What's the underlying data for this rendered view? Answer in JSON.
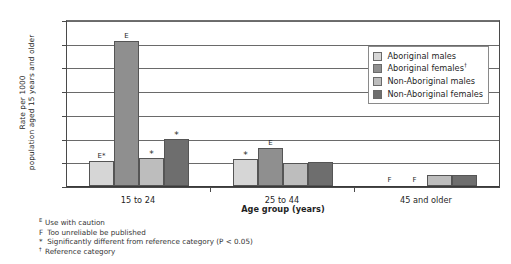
{
  "chart_data": {
    "type": "bar",
    "title": "",
    "xlabel": "Age group (years)",
    "ylabel": "Rate per 1000 population aged 15 years and older",
    "categories": [
      "15 to 24",
      "25 to 44",
      "45 and older"
    ],
    "ylim": [
      0,
      700
    ],
    "yticks": [
      0,
      100,
      200,
      300,
      400,
      500,
      600,
      700
    ],
    "grid": true,
    "legend_position": "top-right-inside",
    "series": [
      {
        "name": "Aboriginal males",
        "color": "#d6d6d6",
        "values": [
          105,
          115,
          null
        ],
        "markers": [
          "E*",
          "*",
          "F"
        ]
      },
      {
        "name": "Aboriginal females†",
        "color": "#8f8f8f",
        "values": [
          612,
          162,
          null
        ],
        "markers": [
          "E",
          "E",
          "F"
        ]
      },
      {
        "name": "Non-Aboriginal males",
        "color": "#bdbdbd",
        "values": [
          118,
          95,
          48
        ],
        "markers": [
          "*",
          "",
          ""
        ]
      },
      {
        "name": "Non-Aboriginal females",
        "color": "#6e6e6e",
        "values": [
          198,
          100,
          48
        ],
        "markers": [
          "*",
          "",
          ""
        ]
      }
    ]
  },
  "yaxis": {
    "title_line1": "Rate per 1000",
    "title_line2": "population aged 15 years and older",
    "ticks": [
      "700",
      "600",
      "500",
      "400",
      "300",
      "200",
      "100",
      "0"
    ]
  },
  "xaxis": {
    "title": "Age group (years)",
    "categories": [
      "15 to 24",
      "25 to 44",
      "45 and older"
    ]
  },
  "legend": {
    "items": [
      {
        "label": "Aboriginal males",
        "color": "#d6d6d6"
      },
      {
        "label": "Aboriginal females",
        "sup": "†",
        "color": "#8f8f8f"
      },
      {
        "label": "Non-Aboriginal males",
        "color": "#bdbdbd"
      },
      {
        "label": "Non-Aboriginal females",
        "color": "#6e6e6e"
      }
    ]
  },
  "footnotes": [
    {
      "symbol": "E",
      "text": "Use with caution"
    },
    {
      "symbol": "F",
      "text": "Too unreliable be published"
    },
    {
      "symbol": "*",
      "text": "Significantly different from reference category (P < 0.05)"
    },
    {
      "symbol": "†",
      "text": "Reference category"
    }
  ],
  "markers": {
    "g0": [
      "E*",
      "E",
      "*",
      "*"
    ],
    "g1": [
      "*",
      "E",
      "",
      ""
    ],
    "g2": [
      "F",
      "F",
      "",
      ""
    ]
  }
}
